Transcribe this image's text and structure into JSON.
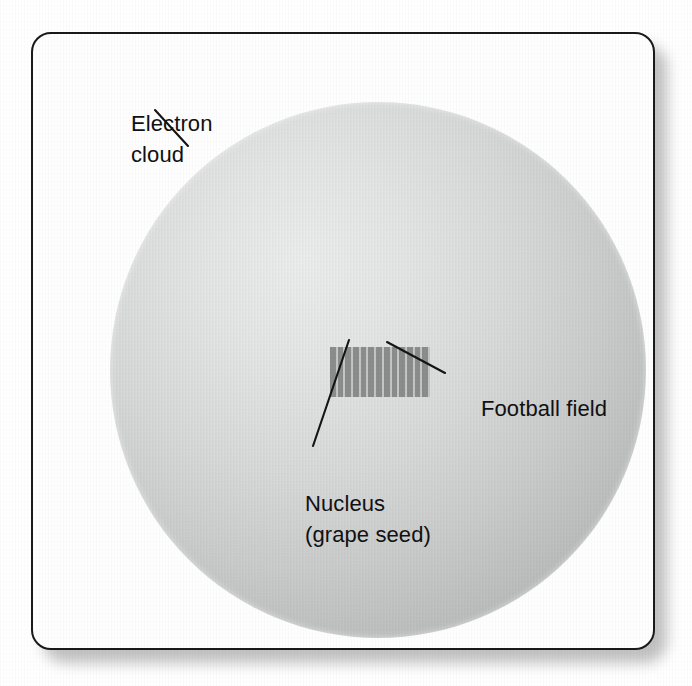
{
  "figure": {
    "type": "scale-analogy-diagram",
    "ghost_text": "bleed-through text from reverse side of page (illegible)"
  },
  "labels": {
    "electron_cloud": {
      "line1": "Electron",
      "line2": "cloud"
    },
    "football_field": "Football field",
    "nucleus": {
      "line1": "Nucleus",
      "line2": "(grape seed)"
    }
  },
  "colors": {
    "frame_border": "#1a1a1a",
    "page_background": "#ffffff",
    "figure_background": "#fefefe",
    "cloud_light": "#eceded",
    "cloud_dark": "#a6a8a8",
    "field_stripe_dark": "#8b8d8d",
    "field_stripe_light": "#c4c6c6",
    "label_text": "#111111",
    "leader_line": "#141414",
    "drop_shadow": "#8d8d8d"
  },
  "geometry": {
    "canvas": {
      "width": 692,
      "height": 686
    },
    "frame": {
      "x": 31,
      "y": 32,
      "width": 624,
      "height": 618,
      "corner_radius": 20
    },
    "electron_cloud": {
      "center_x": 345,
      "center_y": 336,
      "radius": 268
    },
    "football_field": {
      "x": 297,
      "y": 313,
      "width": 100,
      "height": 50,
      "stripe_count": 13
    },
    "leaders": [
      {
        "name": "electron-cloud-leader",
        "x1": 153,
        "y1": 108,
        "x2": 186,
        "y2": 144
      },
      {
        "name": "football-field-leader",
        "x1": 385,
        "y1": 340,
        "x2": 443,
        "y2": 371
      },
      {
        "name": "nucleus-leader",
        "x1": 347,
        "y1": 338,
        "x2": 311,
        "y2": 444
      }
    ]
  }
}
